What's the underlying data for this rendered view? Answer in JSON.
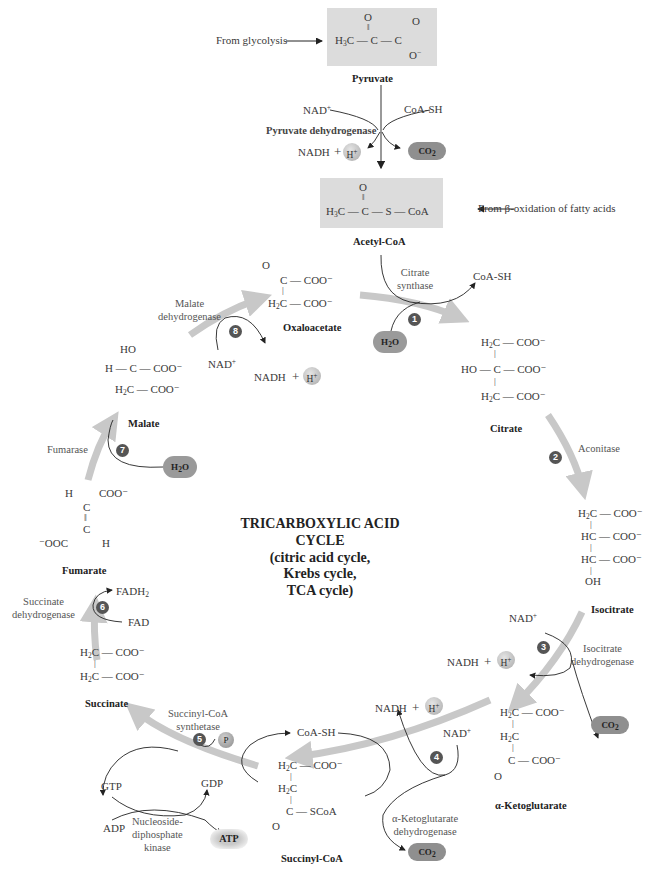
{
  "diagram": {
    "title_lines": [
      "TRICARBOXYLIC ACID",
      "CYCLE",
      "(citric acid cycle,",
      "Krebs cycle,",
      "TCA cycle)"
    ],
    "inputs": {
      "from_glycolysis": "From glycolysis",
      "from_beta_oxidation": "From β-oxidation of fatty acids"
    },
    "molecules": {
      "pyruvate": "Pyruvate",
      "acetyl_coa": "Acetyl-CoA",
      "oxaloacetate": "Oxaloacetate",
      "citrate": "Citrate",
      "isocitrate": "Isocitrate",
      "alpha_ketoglutarate": "α-Ketoglutarate",
      "succinyl_coa": "Succinyl-CoA",
      "succinate": "Succinate",
      "fumarate": "Fumarate",
      "malate": "Malate"
    },
    "enzymes": {
      "pyruvate_dehydrogenase": "Pyruvate dehydrogenase",
      "citrate_synthase": [
        "Citrate",
        "synthase"
      ],
      "aconitase": "Aconitase",
      "isocitrate_dehydrogenase": [
        "Isocitrate",
        "dehydrogenase"
      ],
      "akg_dehydrogenase": [
        "α-Ketoglutarate",
        "dehydrogenase"
      ],
      "succinyl_coa_synthetase": [
        "Succinyl-CoA",
        "synthetase"
      ],
      "ndp_kinase": [
        "Nucleoside-",
        "diphosphate",
        "kinase"
      ],
      "succinate_dehydrogenase": [
        "Succinate",
        "dehydrogenase"
      ],
      "fumarase": "Fumarase",
      "malate_dehydrogenase": [
        "Malate",
        "dehydrogenase"
      ]
    },
    "steps": [
      "1",
      "2",
      "3",
      "4",
      "5",
      "6",
      "7",
      "8"
    ],
    "cofactors": {
      "nad_plus": "NAD",
      "nadh": "NADH",
      "plus": "+",
      "h_plus": "H",
      "coa_sh": "CoA-SH",
      "co2": "CO",
      "h2o_h": "H",
      "h2o_o": "O",
      "fad": "FAD",
      "fadh2": "FADH",
      "gdp": "GDP",
      "gtp": "GTP",
      "adp": "ADP",
      "atp": "ATP",
      "pi": "P"
    },
    "structures": {
      "pyruvate": {
        "o_top": "O",
        "o_right": "O",
        "o_minus": "O",
        "h3c": "H",
        "c": "C"
      },
      "acetyl_coa": {
        "o": "O",
        "row": "C — C — S — CoA",
        "h3c": "H"
      },
      "oxaloacetate": {
        "o": "O",
        "r1": "C — COO⁻",
        "r2": "C — COO⁻",
        "h2c": "H"
      },
      "citrate": {
        "r1": "C — COO⁻",
        "r2": "HO — C — COO⁻",
        "r3": "C — COO⁻"
      },
      "isocitrate": {
        "r1": "C — COO⁻",
        "r2": "HC — COO⁻",
        "r3": "HC — COO⁻",
        "r4": "OH"
      },
      "akg": {
        "r1": "C — COO⁻",
        "r2": "C",
        "r3": "C — COO⁻",
        "o": "O"
      },
      "succinyl_coa": {
        "r1": "C — COO⁻",
        "r2": "C",
        "r3": "C — SCoA",
        "o": "O"
      },
      "succinate": {
        "r1": "C — COO⁻",
        "r2": "C — COO⁻"
      },
      "fumarate": {
        "h1": "H",
        "coo": "COO⁻",
        "c": "C",
        "ooc": "⁻OOC",
        "h2": "H"
      },
      "malate": {
        "ho": "HO",
        "r2": "H — C — COO⁻",
        "r3": "C — COO⁻"
      }
    },
    "colors": {
      "cycle_arrow": "#c8c8c8",
      "box_fill": "#dcdcdc",
      "step_badge": "#555555",
      "co2_fill": "#8f8f8f"
    }
  }
}
